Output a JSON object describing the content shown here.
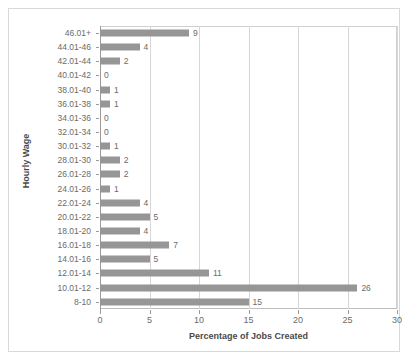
{
  "chart_data": {
    "type": "bar",
    "orientation": "horizontal",
    "title": "",
    "xlabel": "Percentage of Jobs Created",
    "ylabel": "Hourly Wage",
    "xlim": [
      0,
      30
    ],
    "xticks": [
      0,
      5,
      10,
      15,
      20,
      25,
      30
    ],
    "grid": true,
    "legend": false,
    "bar_color": "#969696",
    "categories": [
      "46.01+",
      "44.01-46",
      "42.01-44",
      "40.01-42",
      "38.01-40",
      "36.01-38",
      "34.01-36",
      "32.01-34",
      "30.01-32",
      "28.01-30",
      "26.01-28",
      "24.01-26",
      "22.01-24",
      "20.01-22",
      "18.01-20",
      "16.01-18",
      "14.01-16",
      "12.01-14",
      "10.01-12",
      "8-10"
    ],
    "values": [
      9,
      4,
      2,
      0,
      1,
      1,
      0,
      0,
      1,
      2,
      2,
      1,
      4,
      5,
      4,
      7,
      5,
      11,
      26,
      15
    ],
    "data_labels": [
      "9",
      "4",
      "2",
      "0",
      "1",
      "1",
      "0",
      "0",
      "1",
      "2",
      "2",
      "1",
      "4",
      "5",
      "4",
      "7",
      "5",
      "11",
      "26",
      "15"
    ],
    "xtick_labels": [
      "0",
      "5",
      "10",
      "15",
      "20",
      "25",
      "30"
    ]
  }
}
